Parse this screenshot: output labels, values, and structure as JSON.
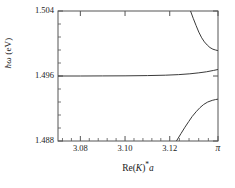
{
  "figure": {
    "background_color": "#ffffff",
    "line_color": "#3a3a3a",
    "axis_color": "#555555",
    "text_color": "#1a1a1a"
  },
  "axes": {
    "ylabel_prefix": "ħω",
    "ylabel_suffix": " (eV)",
    "xlabel_prefix": "Re(",
    "xlabel_var": "K",
    "xlabel_mid": ")",
    "xlabel_star": "*",
    "xlabel_suffix": "a"
  },
  "chart_data": {
    "type": "line",
    "title": "",
    "xlabel": "Re(K)*a",
    "ylabel": "ħω (eV)",
    "xlim": [
      3.07,
      3.14159265
    ],
    "ylim": [
      1.488,
      1.504
    ],
    "xticks": [
      3.08,
      3.1,
      3.12,
      3.14159265
    ],
    "xticklabels": [
      "3.08",
      "3.10",
      "3.12",
      "π"
    ],
    "yticks": [
      1.488,
      1.496,
      1.504
    ],
    "yticklabels": [
      "1.488",
      "1.496",
      "1.504"
    ],
    "xminor_count": 4,
    "yminor_count": 4,
    "grid": false,
    "legend": null,
    "series": [
      {
        "name": "upper-branch",
        "comment": "Upper polariton branch entering from top of frame, curving down to a flat endpoint at k = pi",
        "x": [
          3.1293,
          3.1305,
          3.1318,
          3.133,
          3.1343,
          3.1355,
          3.1368,
          3.138,
          3.1393,
          3.1405,
          3.1412,
          3.14159
        ],
        "y": [
          1.504,
          1.5031,
          1.5022,
          1.5014,
          1.5007,
          1.5002,
          1.4998,
          1.4995,
          1.4993,
          1.4992,
          1.49915,
          1.49912
        ]
      },
      {
        "name": "middle-branch",
        "comment": "Nearly flat middle branch at about 1.4960 eV, rising slightly near k = pi",
        "x": [
          3.07,
          3.08,
          3.09,
          3.1,
          3.11,
          3.118,
          3.124,
          3.129,
          3.133,
          3.1365,
          3.1395,
          3.14159
        ],
        "y": [
          1.496,
          1.496,
          1.49601,
          1.49602,
          1.49605,
          1.4961,
          1.49617,
          1.49627,
          1.49639,
          1.49652,
          1.49668,
          1.4968
        ]
      },
      {
        "name": "lower-branch",
        "comment": "Lower polariton branch rising from bottom of frame to a flat endpoint just below 1.4930 eV at k = pi",
        "x": [
          3.123,
          3.125,
          3.1268,
          3.1285,
          3.13,
          3.1318,
          3.1335,
          3.1352,
          3.137,
          3.139,
          3.1405,
          3.14159
        ],
        "y": [
          1.488,
          1.4889,
          1.4897,
          1.4904,
          1.491,
          1.4916,
          1.4921,
          1.4925,
          1.4928,
          1.493,
          1.4931,
          1.49315
        ]
      }
    ]
  }
}
